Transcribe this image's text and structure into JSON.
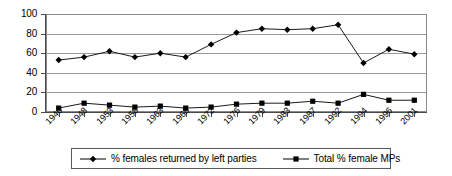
{
  "chart_data": {
    "type": "line",
    "title": "",
    "xlabel": "",
    "ylabel": "",
    "ylim": [
      0,
      100
    ],
    "ytick_values": [
      0,
      20,
      40,
      60,
      80,
      100
    ],
    "ytick_labels": [
      "0",
      "20",
      "40",
      "60",
      "80",
      "100"
    ],
    "grid": "horizontal",
    "legend_position": "bottom",
    "categories": [
      "1946",
      "1948",
      "1953",
      "1958",
      "1963",
      "1968",
      "1972",
      "1976",
      "1979",
      "1983",
      "1987",
      "1992",
      "1994",
      "1996",
      "2001"
    ],
    "series": [
      {
        "name": "% females returned by left parties",
        "marker": "diamond",
        "color": "#000000",
        "values": [
          53,
          56,
          62,
          56,
          60,
          56,
          69,
          81,
          85,
          84,
          85,
          89,
          50,
          64,
          59
        ]
      },
      {
        "name": "Total % female MPs",
        "marker": "square",
        "color": "#000000",
        "values": [
          4,
          9,
          7,
          5,
          6,
          4,
          5,
          8,
          9,
          9,
          11,
          9,
          18,
          12,
          12
        ]
      }
    ]
  },
  "legend": {
    "entries": [
      {
        "label": "% females returned by left parties",
        "marker": "diamond"
      },
      {
        "label": "Total % female MPs",
        "marker": "square"
      }
    ]
  },
  "colors": {
    "axis": "#4a4a4a",
    "grid": "#9a9a9a",
    "frame": "#8a8a8a",
    "series": "#000000",
    "background": "#ffffff"
  }
}
